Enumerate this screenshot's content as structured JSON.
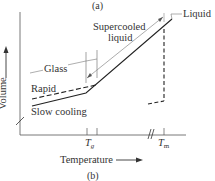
{
  "figure": {
    "caption_top": "(a)",
    "caption_bottom": "(b)",
    "y_axis_label": "Volume",
    "x_axis_label": "Temperature",
    "labels": {
      "glass": "Glass",
      "rapid": "Rapid",
      "slow_cooling": "Slow cooling",
      "supercooled_line1": "Supercooled",
      "supercooled_line2": "liquid",
      "liquid": "Liquid"
    },
    "ticks": {
      "tg_main": "T",
      "tg_sub": "g",
      "tm_main": "T",
      "tm_sub": "m"
    },
    "colors": {
      "line": "#2a2a2a",
      "background": "#ffffff"
    }
  }
}
